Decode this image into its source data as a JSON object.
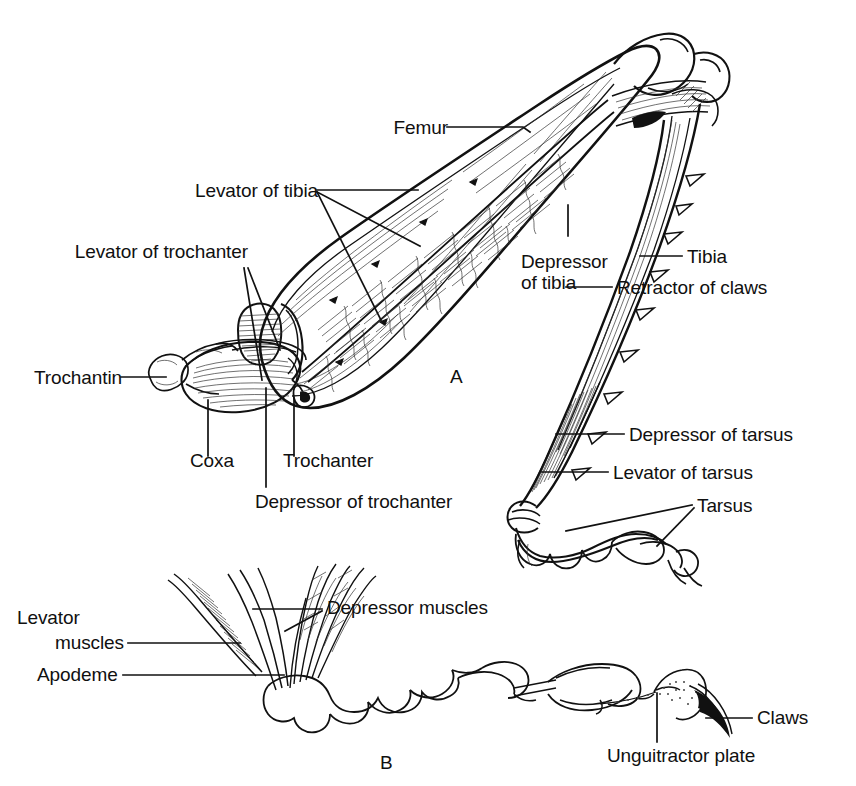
{
  "figure": {
    "background_color": "#ffffff",
    "ink_color": "#111111",
    "panels": [
      {
        "id": "A",
        "label": "A",
        "caption": "Longitudinal section of insect leg showing coxa, trochanter, femur, tibia and tarsus with their muscles"
      },
      {
        "id": "B",
        "label": "B",
        "caption": "Tarsus and pretarsus showing levator and depressor muscles, apodeme, unguitractor plate and claws"
      }
    ]
  },
  "panel_a": {
    "figure_label": "A",
    "labels": [
      {
        "key": "femur",
        "text": "Femur"
      },
      {
        "key": "levator_of_tibia",
        "text": "Levator of tibia"
      },
      {
        "key": "levator_of_trochanter",
        "text": "Levator of trochanter"
      },
      {
        "key": "trochantin",
        "text": "Trochantin"
      },
      {
        "key": "coxa",
        "text": "Coxa"
      },
      {
        "key": "trochanter",
        "text": "Trochanter"
      },
      {
        "key": "depressor_of_trochanter",
        "text": "Depressor of trochanter"
      },
      {
        "key": "depressor_of_tibia_l1",
        "text": "Depressor"
      },
      {
        "key": "depressor_of_tibia_l2",
        "text": "of tibia"
      },
      {
        "key": "tibia",
        "text": "Tibia"
      },
      {
        "key": "retractor_of_claws",
        "text": "Retractor of claws"
      },
      {
        "key": "depressor_of_tarsus",
        "text": "Depressor of tarsus"
      },
      {
        "key": "levator_of_tarsus",
        "text": "Levator of tarsus"
      },
      {
        "key": "tarsus",
        "text": "Tarsus"
      }
    ]
  },
  "panel_b": {
    "figure_label": "B",
    "labels": [
      {
        "key": "levator_muscles_l1",
        "text": "Levator"
      },
      {
        "key": "levator_muscles_l2",
        "text": "muscles"
      },
      {
        "key": "apodeme",
        "text": "Apodeme"
      },
      {
        "key": "depressor_muscles",
        "text": "Depressor muscles"
      },
      {
        "key": "claws",
        "text": "Claws"
      },
      {
        "key": "unguitractor_plate",
        "text": "Unguitractor plate"
      }
    ]
  }
}
